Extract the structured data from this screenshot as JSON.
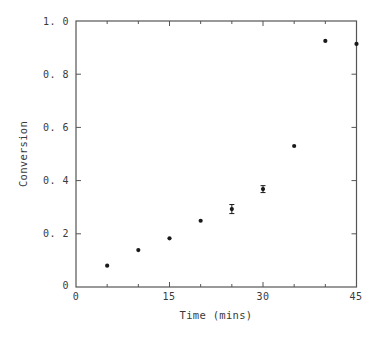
{
  "chart_data": {
    "type": "scatter",
    "title": "",
    "xlabel": "Time (mins)",
    "ylabel": "Conversion",
    "xlim": [
      0,
      45
    ],
    "ylim": [
      0,
      1.0
    ],
    "x_ticks": [
      0,
      15,
      30,
      45
    ],
    "x_tick_labels": [
      "0",
      "15",
      "30",
      "45"
    ],
    "x_minor_ticks": [
      5,
      10,
      20,
      25,
      35,
      40
    ],
    "y_ticks": [
      0,
      0.2,
      0.4,
      0.6,
      0.8,
      1.0
    ],
    "y_tick_labels": [
      "0",
      "0.2",
      "0.4",
      "0.6",
      "0.8",
      "1.0"
    ],
    "grid": false,
    "legend": null,
    "series": [
      {
        "name": "Conversion",
        "x": [
          5,
          10,
          15,
          20,
          25,
          30,
          35,
          40,
          45
        ],
        "y": [
          0.08,
          0.139,
          0.183,
          0.249,
          0.293,
          0.368,
          0.53,
          0.925,
          0.914
        ],
        "error": [
          0,
          0,
          0,
          0,
          0.017,
          0.013,
          0,
          0,
          0
        ]
      }
    ]
  },
  "labels": {
    "xlabel": "Time (mins)",
    "ylabel": "Conversion",
    "x_ticks": [
      "0",
      "15",
      "30",
      "45"
    ],
    "y_ticks": [
      "0",
      "0. 2",
      "0. 4",
      "0. 6",
      "0. 8",
      "1. 0"
    ]
  },
  "colors": {
    "axis": "#555555",
    "point": "#1a1a1a",
    "text": "#3a3a3a"
  }
}
